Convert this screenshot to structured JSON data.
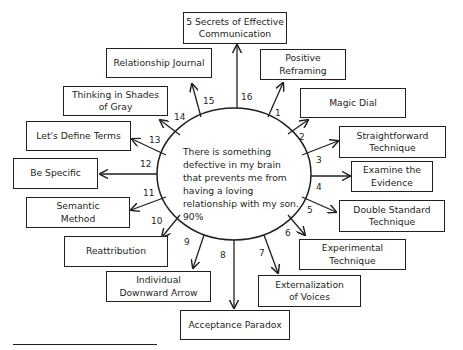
{
  "diagram": {
    "center": {
      "text": "There is something defective in my brain that prevents me from having a loving relationship with my son. 90%"
    },
    "techniques": [
      {
        "num": "1",
        "label": "Positive\nReframing"
      },
      {
        "num": "2",
        "label": "Magic Dial"
      },
      {
        "num": "3",
        "label": "Straightforward\nTechnique"
      },
      {
        "num": "4",
        "label": "Examine the\nEvidence"
      },
      {
        "num": "5",
        "label": "Double Standard\nTechnique"
      },
      {
        "num": "6",
        "label": "Experimental\nTechnique"
      },
      {
        "num": "7",
        "label": "Externalization\nof Voices"
      },
      {
        "num": "8",
        "label": "Acceptance Paradox"
      },
      {
        "num": "9",
        "label": "Individual\nDownward Arrow"
      },
      {
        "num": "10",
        "label": "Reattribution"
      },
      {
        "num": "11",
        "label": "Semantic\nMethod"
      },
      {
        "num": "12",
        "label": "Be Specific"
      },
      {
        "num": "13",
        "label": "Let's Define Terms"
      },
      {
        "num": "14",
        "label": "Thinking in Shades\nof Gray"
      },
      {
        "num": "15",
        "label": "Relationship Journal"
      },
      {
        "num": "16",
        "label": "5 Secrets of Effective\nCommunication"
      }
    ],
    "colors": {
      "stroke": "#231f20",
      "background": "#ffffff"
    }
  }
}
